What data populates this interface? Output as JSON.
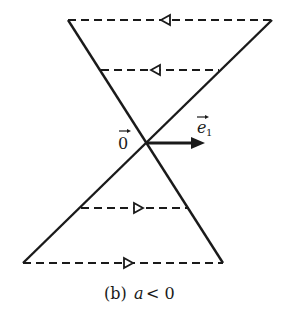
{
  "diagram": {
    "caption": "(b) a < 0",
    "caption_prefix": "(b)",
    "caption_var": "a",
    "caption_rel": "< 0",
    "origin_label": "0",
    "vector_label": "e",
    "vector_subscript": "1",
    "colors": {
      "line": "#1a1a1a",
      "background": "#ffffff"
    },
    "origin": {
      "x": 147,
      "y": 143
    },
    "solid_lines": [
      {
        "name": "line-descending",
        "from": [
          68,
          20
        ],
        "to": [
          223,
          263
        ]
      },
      {
        "name": "line-ascending",
        "from": [
          272,
          20
        ],
        "to": [
          23,
          263
        ]
      }
    ],
    "dashed_lines": [
      {
        "y": 20,
        "x1": 68,
        "x2": 272,
        "arrow_x": 167,
        "direction": "left"
      },
      {
        "y": 70,
        "x1": 100,
        "x2": 219,
        "arrow_x": 157,
        "direction": "left"
      },
      {
        "y": 208,
        "x1": 81,
        "x2": 189,
        "arrow_x": 137,
        "direction": "right"
      },
      {
        "y": 263,
        "x1": 23,
        "x2": 223,
        "arrow_x": 127,
        "direction": "right"
      }
    ],
    "basis_vector": {
      "from": [
        147,
        143
      ],
      "to": [
        202,
        143
      ]
    }
  }
}
